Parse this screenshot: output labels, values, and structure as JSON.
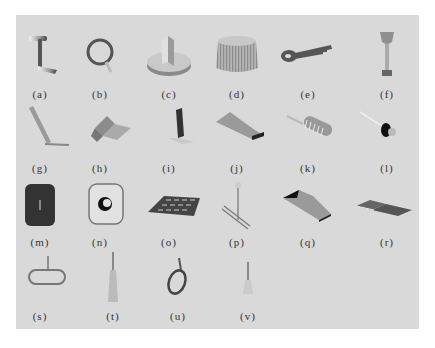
{
  "figure": {
    "background": "#d9d9d9",
    "items": [
      {
        "label": "(a)",
        "icon": "t-handle-lever-icon"
      },
      {
        "label": "(b)",
        "icon": "ring-pull-handle-icon"
      },
      {
        "label": "(c)",
        "icon": "round-knob-with-fin-icon"
      },
      {
        "label": "(d)",
        "icon": "ridged-cylinder-knob-icon"
      },
      {
        "label": "(e)",
        "icon": "key-icon"
      },
      {
        "label": "(f)",
        "icon": "stick-shift-knob-icon"
      },
      {
        "label": "(g)",
        "icon": "slanted-lever-icon"
      },
      {
        "label": "(h)",
        "icon": "bent-plate-icon"
      },
      {
        "label": "(i)",
        "icon": "l-bracket-plate-icon"
      },
      {
        "label": "(j)",
        "icon": "tapered-slot-plate-icon"
      },
      {
        "label": "(k)",
        "icon": "ribbed-paddle-icon"
      },
      {
        "label": "(l)",
        "icon": "push-pin-icon"
      },
      {
        "label": "(m)",
        "icon": "dark-rounded-panel-icon"
      },
      {
        "label": "(n)",
        "icon": "rounded-square-with-hole-icon"
      },
      {
        "label": "(o)",
        "icon": "keypad-icon"
      },
      {
        "label": "(p)",
        "icon": "rod-with-ball-and-rails-icon"
      },
      {
        "label": "(q)",
        "icon": "curved-ramp-plate-icon"
      },
      {
        "label": "(r)",
        "icon": "flat-folded-plate-icon"
      },
      {
        "label": "(s)",
        "icon": "oval-loop-handle-icon"
      },
      {
        "label": "(t)",
        "icon": "tall-tapered-post-icon"
      },
      {
        "label": "(u)",
        "icon": "oval-ring-handle-icon"
      },
      {
        "label": "(v)",
        "icon": "short-tapered-post-icon"
      }
    ]
  }
}
